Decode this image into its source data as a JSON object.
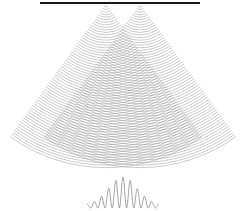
{
  "diagram": {
    "colors": {
      "background": "#ffffff",
      "barrier": "#1a1a1a",
      "wavefront": "#8a8a8a",
      "pattern": "#8f8f8f"
    },
    "barrier": {
      "x1": 40,
      "x2": 200,
      "y": 3,
      "thickness": 2
    },
    "slits": [
      {
        "id": "slit-left",
        "x": 106,
        "y": 4
      },
      {
        "id": "slit-right",
        "x": 140,
        "y": 4
      }
    ],
    "wavefronts": {
      "count": 64,
      "spacing": 2.55,
      "start_radius": 3,
      "half_angle_deg": 36
    },
    "intensity_pattern": {
      "center_x": 123,
      "baseline_y": 208,
      "half_width": 36,
      "max_height": 31,
      "fringe_period": 7.2,
      "envelope_width": 18
    }
  }
}
